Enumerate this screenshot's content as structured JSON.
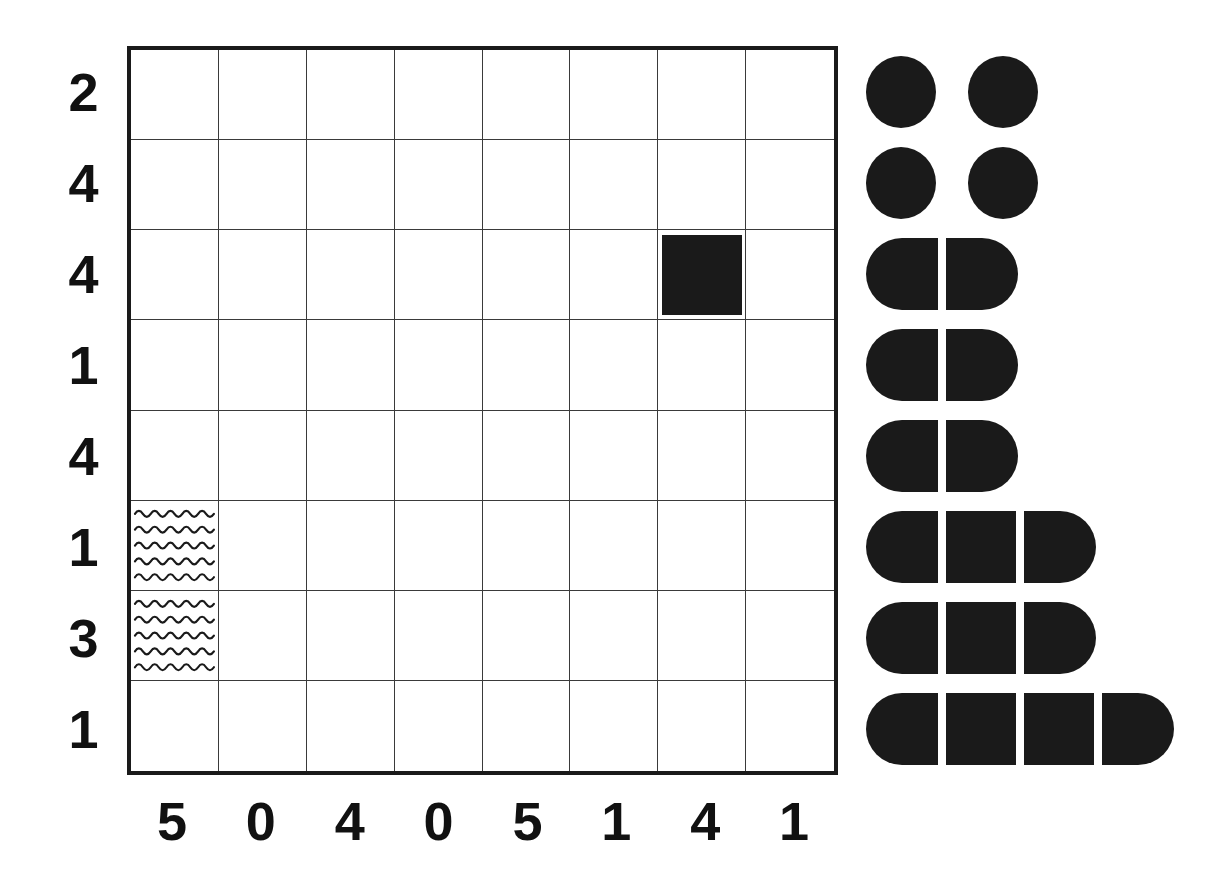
{
  "puzzle": {
    "title": "Nonogram-style grid puzzle",
    "grid_size": {
      "columns": 8,
      "rows": 8
    },
    "row_clues": [
      "2",
      "4",
      "4",
      "1",
      "4",
      "1",
      "3",
      "1"
    ],
    "column_clues": [
      "5",
      "0",
      "4",
      "0",
      "5",
      "1",
      "4",
      "1"
    ],
    "colors": {
      "ink": "#1a1a1a",
      "gridline": "#3a3a3a",
      "background": "#ffffff"
    },
    "cells": [
      {
        "row": 2,
        "col": 6,
        "mark": "filled"
      },
      {
        "row": 5,
        "col": 0,
        "mark": "wavy"
      },
      {
        "row": 6,
        "col": 0,
        "mark": "wavy"
      }
    ]
  },
  "legend": {
    "name": "piece-size-key",
    "rows": [
      {
        "index": 0,
        "segments": [
          "circle",
          "gap",
          "circle"
        ],
        "piece_count": 2,
        "shape": "two-separate-circles"
      },
      {
        "index": 1,
        "segments": [
          "circle",
          "gap",
          "circle"
        ],
        "piece_count": 2,
        "shape": "two-separate-circles"
      },
      {
        "index": 2,
        "segments": [
          "cap-left",
          "cap-right"
        ],
        "piece_count": 2,
        "shape": "split-pill-2"
      },
      {
        "index": 3,
        "segments": [
          "cap-left",
          "cap-right"
        ],
        "piece_count": 2,
        "shape": "split-pill-2"
      },
      {
        "index": 4,
        "segments": [
          "cap-left",
          "cap-right"
        ],
        "piece_count": 2,
        "shape": "split-pill-2"
      },
      {
        "index": 5,
        "segments": [
          "cap-left",
          "mid",
          "cap-right"
        ],
        "piece_count": 3,
        "shape": "split-pill-3"
      },
      {
        "index": 6,
        "segments": [
          "cap-left",
          "mid",
          "cap-right"
        ],
        "piece_count": 3,
        "shape": "split-pill-3"
      },
      {
        "index": 7,
        "segments": [
          "cap-left",
          "mid",
          "mid",
          "cap-right"
        ],
        "piece_count": 4,
        "shape": "split-pill-4"
      }
    ]
  },
  "chart_data": {
    "type": "table",
    "categories": [
      "C1",
      "C2",
      "C3",
      "C4",
      "C5",
      "C6",
      "C7",
      "C8"
    ],
    "column_clues": [
      5,
      0,
      4,
      0,
      5,
      1,
      4,
      1
    ],
    "row_clues": [
      2,
      4,
      4,
      1,
      4,
      1,
      3,
      1
    ],
    "grid": [
      [
        "",
        "",
        "",
        "",
        "",
        "",
        "",
        ""
      ],
      [
        "",
        "",
        "",
        "",
        "",
        "",
        "",
        ""
      ],
      [
        "",
        "",
        "",
        "",
        "",
        "",
        "filled",
        ""
      ],
      [
        "",
        "",
        "",
        "",
        "",
        "",
        "",
        ""
      ],
      [
        "",
        "",
        "",
        "",
        "",
        "",
        "",
        ""
      ],
      [
        "wavy",
        "",
        "",
        "",
        "",
        "",
        "",
        ""
      ],
      [
        "wavy",
        "",
        "",
        "",
        "",
        "",
        "",
        ""
      ],
      [
        "",
        "",
        "",
        "",
        "",
        "",
        "",
        ""
      ]
    ],
    "legend_piece_counts": [
      2,
      2,
      2,
      2,
      2,
      3,
      3,
      4
    ],
    "xlabel": "",
    "ylabel": "",
    "grid_on": true,
    "legend_position": "right"
  }
}
